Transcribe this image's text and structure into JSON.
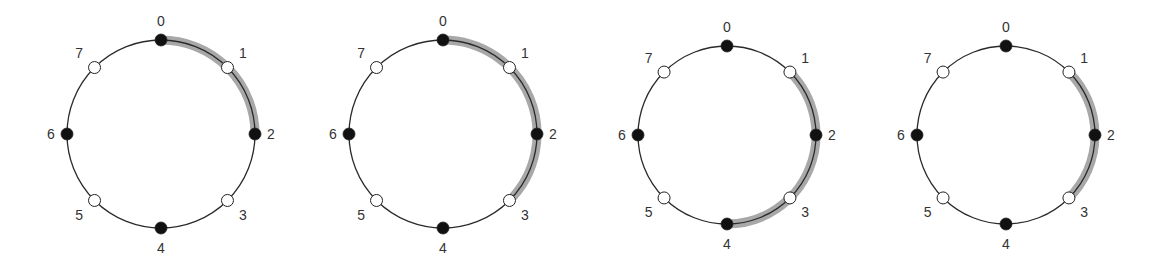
{
  "figure": {
    "colors": {
      "ring_stroke": "#2a2a2a",
      "highlight": "#a8a8a8",
      "filled_node": "#111111",
      "hollow_node_fill": "#ffffff",
      "label": "#333333"
    },
    "node_labels": [
      "0",
      "1",
      "2",
      "3",
      "4",
      "5",
      "6",
      "7"
    ],
    "filled_nodes": [
      0,
      2,
      4,
      6
    ],
    "hollow_nodes": [
      1,
      3,
      5,
      7
    ],
    "rings": [
      {
        "id": "ring-1",
        "cx": 161,
        "cy": 134,
        "r": 94,
        "highlight_from": 0,
        "highlight_to": 2
      },
      {
        "id": "ring-2",
        "cx": 443,
        "cy": 134,
        "r": 94,
        "highlight_from": 0,
        "highlight_to": 3
      },
      {
        "id": "ring-3",
        "cx": 727,
        "cy": 135,
        "r": 89,
        "highlight_from": 1,
        "highlight_to": 4
      },
      {
        "id": "ring-4",
        "cx": 1006,
        "cy": 135,
        "r": 89,
        "highlight_from": 1,
        "highlight_to": 3
      }
    ]
  }
}
